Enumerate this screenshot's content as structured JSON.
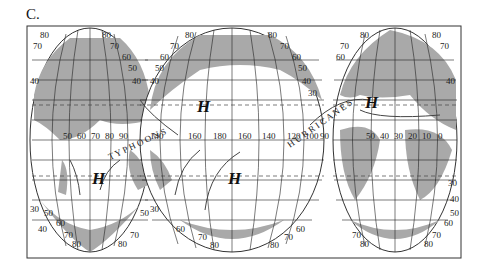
{
  "figure": {
    "label": "C.",
    "type": "interrupted world map with pressure systems and wind arrows"
  },
  "map": {
    "high_pressure_symbol": "H",
    "high_pressure_labels": [
      {
        "id": "h-north-pacific",
        "text": "H"
      },
      {
        "id": "h-north-atlantic",
        "text": "H"
      },
      {
        "id": "h-south-indian",
        "text": "H"
      },
      {
        "id": "h-south-pacific",
        "text": "H"
      }
    ],
    "latitude_labels": [
      "80",
      "70",
      "60",
      "50",
      "40",
      "30"
    ],
    "longitude_labels_left": [
      "50",
      "60",
      "70",
      "80",
      "90"
    ],
    "longitude_labels_middle": [
      "120",
      "140",
      "160",
      "180",
      "160",
      "140",
      "120",
      "100",
      "90"
    ],
    "longitude_labels_right": [
      "50",
      "40",
      "30",
      "20",
      "10",
      "0"
    ],
    "curved_label_left": "T Y P H O O N S",
    "curved_label_right": "H U R R I C A N E S",
    "colors": {
      "land": "#a9a9a9",
      "ocean": "#ffffff",
      "grid": "#222222",
      "dashed_line": "#444444"
    }
  }
}
